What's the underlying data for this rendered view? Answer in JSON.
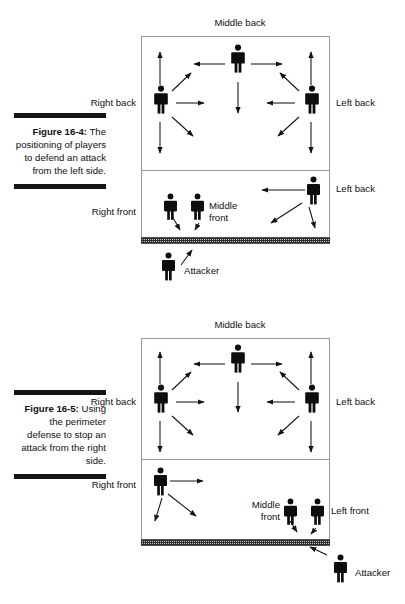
{
  "page": {
    "width": 405,
    "height": 604,
    "background": "#ffffff",
    "ink": "#101010",
    "court_line_color": "#9a9a9a",
    "rule_color": "#141414"
  },
  "figures": [
    {
      "id": "figure-16-4",
      "caption": {
        "number": "Figure 16-4:",
        "text": "The positioning of players to defend an attack from the left side.",
        "full": "Figure 16-4: The positioning of players to defend an attack from the left side."
      },
      "court": {
        "top_label": "Middle back",
        "has_attack_line": true,
        "has_net": true
      },
      "labels": [
        {
          "name": "middle-back",
          "text": "Middle back",
          "position": "top-center"
        },
        {
          "name": "right-back",
          "text": "Right back",
          "position": "left-backcourt"
        },
        {
          "name": "left-back",
          "text": "Left back",
          "position": "right-backcourt"
        },
        {
          "name": "right-front",
          "text": "Right front",
          "position": "left-frontcourt"
        },
        {
          "name": "middle-front",
          "text": "Middle front",
          "position": "center-frontcourt"
        },
        {
          "name": "left-back-front",
          "text": "Left back",
          "position": "right-frontcourt"
        },
        {
          "name": "attacker",
          "text": "Attacker",
          "position": "below-net-left"
        }
      ],
      "players": [
        {
          "name": "middle-back-player",
          "role": "Middle back",
          "zone": "backcourt"
        },
        {
          "name": "right-back-player",
          "role": "Right back",
          "zone": "backcourt"
        },
        {
          "name": "left-back-player",
          "role": "Left back",
          "zone": "backcourt"
        },
        {
          "name": "right-front-player",
          "role": "Right front",
          "zone": "frontcourt"
        },
        {
          "name": "middle-front-player",
          "role": "Middle front",
          "zone": "frontcourt"
        },
        {
          "name": "left-back-frontcourt-player",
          "role": "Left back",
          "zone": "frontcourt"
        },
        {
          "name": "attacker-player",
          "role": "Attacker",
          "zone": "opponent-side"
        }
      ]
    },
    {
      "id": "figure-16-5",
      "caption": {
        "number": "Figure 16-5:",
        "text": "Using the perimeter defense to stop an attack from the right side.",
        "full": "Figure 16-5: Using the perimeter defense to stop an attack from the right side."
      },
      "court": {
        "top_label": "Middle back",
        "has_attack_line": true,
        "has_net": true
      },
      "labels": [
        {
          "name": "middle-back",
          "text": "Middle back",
          "position": "top-center"
        },
        {
          "name": "right-back",
          "text": "Right back",
          "position": "left-backcourt"
        },
        {
          "name": "left-back",
          "text": "Left back",
          "position": "right-backcourt"
        },
        {
          "name": "right-front",
          "text": "Right front",
          "position": "left-frontcourt"
        },
        {
          "name": "middle-front",
          "text": "Middle front",
          "position": "center-frontcourt"
        },
        {
          "name": "left-front",
          "text": "Left front",
          "position": "right-frontcourt"
        },
        {
          "name": "attacker",
          "text": "Attacker",
          "position": "below-net-right"
        }
      ],
      "players": [
        {
          "name": "middle-back-player",
          "role": "Middle back",
          "zone": "backcourt"
        },
        {
          "name": "right-back-player",
          "role": "Right back",
          "zone": "backcourt"
        },
        {
          "name": "left-back-player",
          "role": "Left back",
          "zone": "backcourt"
        },
        {
          "name": "right-front-player",
          "role": "Right front",
          "zone": "frontcourt"
        },
        {
          "name": "middle-front-player",
          "role": "Middle front",
          "zone": "frontcourt"
        },
        {
          "name": "left-front-player",
          "role": "Left front",
          "zone": "frontcourt"
        },
        {
          "name": "attacker-player",
          "role": "Attacker",
          "zone": "opponent-side"
        }
      ]
    }
  ]
}
